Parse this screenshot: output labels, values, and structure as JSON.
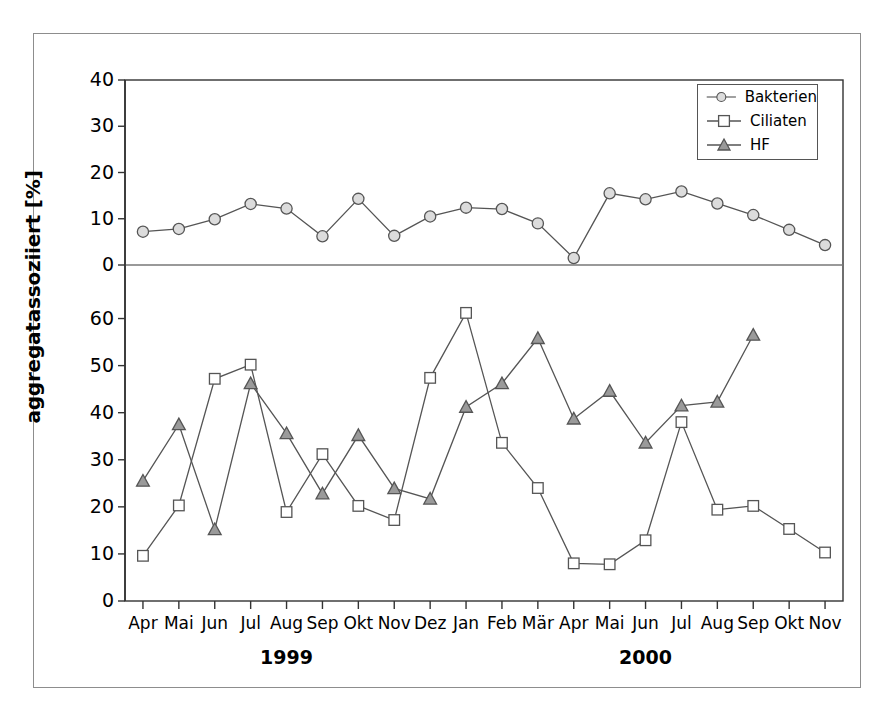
{
  "chart_data": {
    "type": "line",
    "title": "",
    "xlabel": "",
    "ylabel": "aggregatassoziiert [%]",
    "grid": false,
    "legend_position": "top-right",
    "panels": [
      {
        "name": "upper-panel",
        "ylim": [
          0,
          40
        ],
        "yticks": [
          0,
          10,
          20,
          30,
          40
        ],
        "series": [
          {
            "name": "Bakterien",
            "marker": "circle",
            "marker_fill": "#dcdcdc",
            "line_color": "#555555",
            "values": [
              7.2,
              7.8,
              9.9,
              13.2,
              12.2,
              6.2,
              14.3,
              6.3,
              10.5,
              12.4,
              12.1,
              9.0,
              1.5,
              15.5,
              14.2,
              15.9,
              13.3,
              10.8,
              7.6,
              4.3
            ]
          }
        ]
      },
      {
        "name": "lower-panel",
        "ylim": [
          0,
          65
        ],
        "yticks": [
          0,
          10,
          20,
          30,
          40,
          50,
          60
        ],
        "series": [
          {
            "name": "Ciliaten",
            "marker": "square",
            "marker_fill": "#ffffff",
            "line_color": "#555555",
            "values": [
              9.6,
              20.3,
              47.2,
              50.2,
              18.9,
              31.2,
              20.2,
              17.2,
              47.4,
              61.2,
              33.6,
              24.0,
              8.0,
              7.8,
              12.9,
              38.0,
              19.4,
              20.2,
              15.3,
              10.3
            ]
          },
          {
            "name": "HF",
            "marker": "triangle",
            "marker_fill": "#9a9a9a",
            "line_color": "#555555",
            "values": [
              25.5,
              37.5,
              15.2,
              46.2,
              35.6,
              22.8,
              35.2,
              23.9,
              21.7,
              41.2,
              46.2,
              55.8,
              38.7,
              44.6,
              33.6,
              41.5,
              42.3,
              56.5
            ]
          }
        ]
      }
    ],
    "categories": [
      "Apr",
      "Mai",
      "Jun",
      "Jul",
      "Aug",
      "Sep",
      "Okt",
      "Nov",
      "Dez",
      "Jan",
      "Feb",
      "Mär",
      "Apr",
      "Mai",
      "Jun",
      "Jul",
      "Aug",
      "Sep",
      "Okt",
      "Nov"
    ],
    "year_groups": [
      {
        "label": "1999",
        "start_index": 0,
        "end_index": 8
      },
      {
        "label": "2000",
        "start_index": 9,
        "end_index": 19
      }
    ]
  },
  "legend": {
    "items": [
      {
        "label": "Bakterien",
        "marker": "circle"
      },
      {
        "label": "Ciliaten",
        "marker": "square"
      },
      {
        "label": "HF",
        "marker": "triangle"
      }
    ]
  },
  "colors": {
    "line": "#555555",
    "axis": "#333333",
    "frame": "#8d8d8d",
    "bakterien_fill": "#dcdcdc",
    "ciliaten_fill": "#ffffff",
    "hf_fill": "#9a9a9a"
  }
}
